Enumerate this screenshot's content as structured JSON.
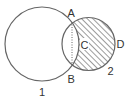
{
  "diagram": {
    "type": "two-intersecting-circles",
    "colors": {
      "stroke": "#666666",
      "hatch": "#666666",
      "label": "#333333",
      "background": "#ffffff"
    },
    "circles": [
      {
        "id": "1",
        "label": "1",
        "cx": 42,
        "cy": 44,
        "r": 37
      },
      {
        "id": "2",
        "label": "2",
        "cx": 88.5,
        "cy": 44,
        "r": 26.5,
        "hatched_region": "circle 2 minus overlap with circle 1"
      }
    ],
    "points": [
      {
        "label": "A",
        "x": 72,
        "y": 22
      },
      {
        "label": "B",
        "x": 72,
        "y": 66
      },
      {
        "label": "C",
        "x": 85,
        "y": 45
      },
      {
        "label": "D",
        "x": 121,
        "y": 43
      }
    ],
    "dotted_segment": {
      "from": "A",
      "to": "B"
    },
    "labels": {
      "A": "A",
      "B": "B",
      "C": "C",
      "D": "D",
      "circle1": "1",
      "circle2": "2"
    }
  }
}
